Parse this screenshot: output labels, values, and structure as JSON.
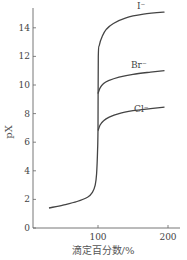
{
  "chart_data": {
    "type": "line",
    "title": "",
    "xlabel": "滴定百分数/%",
    "ylabel": "pX",
    "xlim": [
      0,
      210
    ],
    "ylim": [
      0,
      15.5
    ],
    "x_ticks": [
      100,
      200
    ],
    "y_ticks": [
      0,
      2,
      4,
      6,
      8,
      10,
      12,
      14
    ],
    "grid": false,
    "legend": "inline labels",
    "series": [
      {
        "name": "common (before equivalence)",
        "x": [
          30,
          50,
          70,
          85,
          92,
          96,
          98,
          99.5,
          100
        ],
        "y": [
          1.4,
          1.6,
          1.85,
          2.15,
          2.5,
          3.0,
          3.8,
          5.5,
          6.8
        ]
      },
      {
        "name": "I⁻",
        "label": "I⁻",
        "x": [
          100,
          100.5,
          102,
          106,
          112,
          122,
          140,
          165,
          195
        ],
        "y": [
          6.8,
          12.0,
          12.8,
          13.4,
          13.9,
          14.3,
          14.7,
          14.95,
          15.1
        ]
      },
      {
        "name": "Br⁻",
        "label": "Br⁻",
        "x": [
          100,
          103,
          108,
          115,
          130,
          150,
          175,
          195
        ],
        "y": [
          9.4,
          9.8,
          10.1,
          10.3,
          10.55,
          10.75,
          10.9,
          11.0
        ]
      },
      {
        "name": "Cl⁻",
        "label": "Cl⁻",
        "x": [
          100,
          103,
          108,
          116,
          130,
          150,
          175,
          195
        ],
        "y": [
          6.8,
          7.2,
          7.5,
          7.75,
          8.0,
          8.2,
          8.35,
          8.45
        ]
      }
    ]
  },
  "labels": {
    "ylabel": "pX",
    "xlabel": "滴定百分数/%",
    "curve_I": "I⁻",
    "curve_Br": "Br⁻",
    "curve_Cl": "Cl⁻",
    "yticks": [
      "0",
      "2",
      "4",
      "6",
      "8",
      "10",
      "12",
      "14"
    ],
    "xticks": [
      "100",
      "200"
    ]
  },
  "colors": {
    "line": "#444444",
    "axis": "#555555"
  }
}
